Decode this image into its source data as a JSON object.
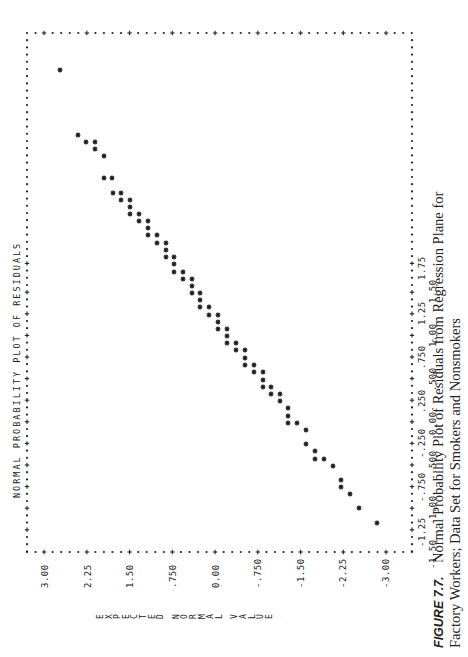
{
  "figure": {
    "label": "FIGURE 7.7.",
    "caption_line1": "Normal Probability Plot of Residuals from Regression Plane for",
    "caption_line2": "Factory Workers; Data Set for Smokers and Nonsmokers",
    "orientation": "rotated 90 degrees counter-clockwise"
  },
  "chart_data": {
    "type": "scatter",
    "title": "NORMAL PROBABILITY PLOT OF RESIDUALS",
    "xlabel": "",
    "ylabel": "EXPECTED NORMAL VALUE",
    "x_ticks": [
      "-1.50",
      "-1.25",
      "-1.00",
      "-.750",
      "-.500",
      "-.250",
      "0.00",
      ".250",
      ".500",
      ".750",
      "1.00",
      "1.25",
      "1.50",
      "1.75"
    ],
    "y_ticks": [
      "3.00",
      "2.25",
      "1.50",
      ".750",
      "0.00",
      "-.750",
      "-1.50",
      "-2.25",
      "-3.00"
    ],
    "xlim": [
      -1.6,
      1.9
    ],
    "ylim": [
      -3.0,
      3.0
    ],
    "grid": false,
    "legend": null,
    "marker": "*",
    "points_screen_px": [
      [
        60,
        70
      ],
      [
        78,
        135
      ],
      [
        86,
        142
      ],
      [
        95,
        142
      ],
      [
        95,
        149
      ],
      [
        104,
        156
      ],
      [
        104,
        178
      ],
      [
        112,
        178
      ],
      [
        113,
        193
      ],
      [
        121,
        193
      ],
      [
        121,
        200
      ],
      [
        130,
        200
      ],
      [
        130,
        207
      ],
      [
        130,
        214
      ],
      [
        139,
        214
      ],
      [
        139,
        221
      ],
      [
        148,
        221
      ],
      [
        148,
        228
      ],
      [
        148,
        235
      ],
      [
        157,
        235
      ],
      [
        157,
        243
      ],
      [
        166,
        243
      ],
      [
        166,
        250
      ],
      [
        166,
        257
      ],
      [
        174,
        257
      ],
      [
        174,
        264
      ],
      [
        174,
        272
      ],
      [
        183,
        272
      ],
      [
        183,
        279
      ],
      [
        192,
        279
      ],
      [
        192,
        286
      ],
      [
        192,
        293
      ],
      [
        200,
        293
      ],
      [
        200,
        300
      ],
      [
        200,
        307
      ],
      [
        209,
        307
      ],
      [
        209,
        315
      ],
      [
        218,
        315
      ],
      [
        218,
        322
      ],
      [
        218,
        329
      ],
      [
        227,
        329
      ],
      [
        227,
        336
      ],
      [
        227,
        343
      ],
      [
        236,
        343
      ],
      [
        236,
        350
      ],
      [
        245,
        350
      ],
      [
        245,
        358
      ],
      [
        245,
        365
      ],
      [
        254,
        365
      ],
      [
        254,
        372
      ],
      [
        263,
        372
      ],
      [
        263,
        380
      ],
      [
        263,
        387
      ],
      [
        271,
        387
      ],
      [
        271,
        394
      ],
      [
        280,
        394
      ],
      [
        280,
        401
      ],
      [
        288,
        408
      ],
      [
        288,
        416
      ],
      [
        288,
        423
      ],
      [
        297,
        423
      ],
      [
        306,
        430
      ],
      [
        306,
        444
      ],
      [
        315,
        451
      ],
      [
        315,
        459
      ],
      [
        324,
        459
      ],
      [
        333,
        466
      ],
      [
        341,
        480
      ],
      [
        341,
        487
      ],
      [
        350,
        494
      ],
      [
        359,
        508
      ],
      [
        377,
        523
      ]
    ],
    "points_note": "Residual (x) ≈ (421 - screen_y)/88; Expected normal value (y) ≈ (216 - screen_x)/56.8"
  },
  "layout": {
    "frame": {
      "left": 27,
      "top": 33,
      "right": 412,
      "bottom": 552
    },
    "y_tick_screen_x": [
      45,
      88,
      130,
      173,
      216,
      258,
      301,
      343,
      386
    ],
    "x_tick_screen_y": [
      555,
      533,
      511,
      488,
      466,
      444,
      421,
      399,
      377,
      355,
      333,
      311,
      289,
      266
    ]
  }
}
